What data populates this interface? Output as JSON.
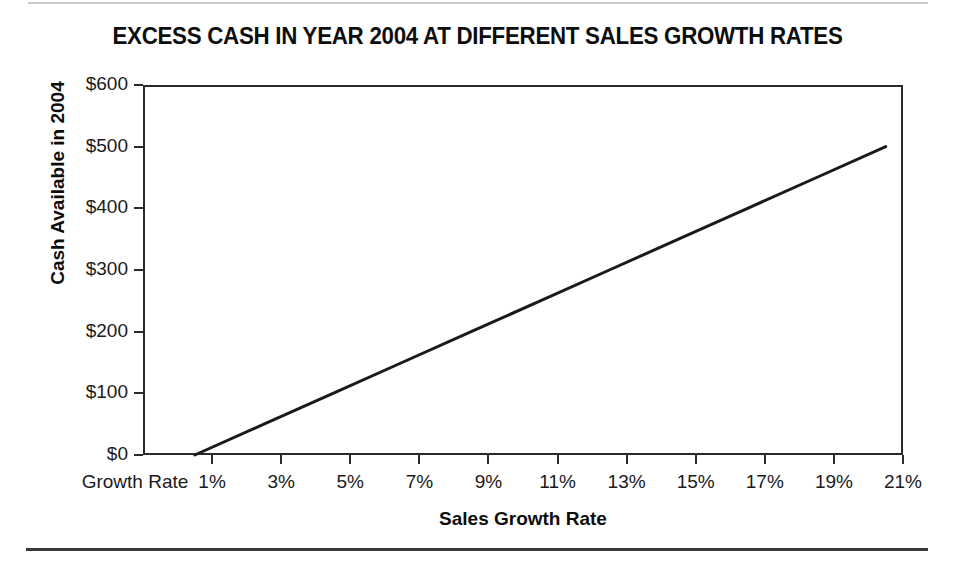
{
  "chart_data": {
    "type": "line",
    "title": "EXCESS CASH IN YEAR 2004 AT DIFFERENT SALES GROWTH RATES",
    "xlabel": "Sales Growth Rate",
    "ylabel": "Cash Available in 2004",
    "x_origin_label": "Growth Rate",
    "x_tick_labels": [
      "1%",
      "3%",
      "5%",
      "7%",
      "9%",
      "11%",
      "13%",
      "15%",
      "17%",
      "19%",
      "21%"
    ],
    "x_tick_values": [
      1,
      3,
      5,
      7,
      9,
      11,
      13,
      15,
      17,
      19,
      21
    ],
    "y_tick_labels": [
      "$0",
      "$100",
      "$200",
      "$300",
      "$400",
      "$500",
      "$600"
    ],
    "y_tick_values": [
      0,
      100,
      200,
      300,
      400,
      500,
      600
    ],
    "xlim": [
      0,
      22
    ],
    "ylim": [
      0,
      600
    ],
    "grid": false,
    "legend": false,
    "series": [
      {
        "name": "Cash Available in 2004",
        "color": "#1a1a1a",
        "x": [
          0.5,
          2.5,
          4.5,
          6.5,
          8.5,
          10.5,
          12.5,
          14.5,
          16.5,
          18.5,
          20.5
        ],
        "values": [
          0,
          50,
          100,
          150,
          200,
          250,
          300,
          350,
          400,
          450,
          500
        ]
      }
    ],
    "annotations": []
  },
  "figure": {
    "top_rule_color": "#c9c9cd",
    "bottom_rule_color": "#3a3a3a",
    "background": "#ffffff",
    "axis_color": "#2b2b2b"
  }
}
